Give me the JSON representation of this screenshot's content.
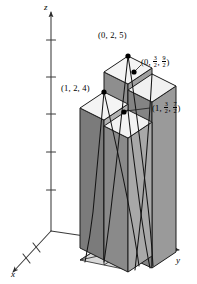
{
  "figure": {
    "kind": "3d-riemann-sum-boxes",
    "background": "#ffffff",
    "ink": "#1a1a1a"
  },
  "axes": {
    "x": {
      "label": "x",
      "direction": "down-left",
      "ticks": 2,
      "arrow": true
    },
    "y": {
      "label": "y",
      "direction": "right",
      "ticks": 0,
      "arrow": true
    },
    "z": {
      "label": "z",
      "direction": "up",
      "ticks": 5,
      "arrow": true
    }
  },
  "points": [
    {
      "id": "p-0-2-5",
      "label_parts": {
        "pre": "(0, 2, 5)",
        "frac1": null,
        "frac2": null
      }
    },
    {
      "id": "p-1-2-4",
      "label_parts": {
        "pre": "(1, 2, 4)",
        "frac1": null,
        "frac2": null
      }
    },
    {
      "id": "p-0-32-92",
      "label_parts": {
        "pre": "(0, ",
        "mid": ", ",
        "post": ")",
        "frac1": {
          "num": "3",
          "den": "2"
        },
        "frac2": {
          "num": "9",
          "den": "2"
        }
      }
    },
    {
      "id": "p-1-32-72",
      "label_parts": {
        "pre": "(1, ",
        "mid": ", ",
        "post": ")",
        "frac1": {
          "num": "3",
          "den": "2"
        },
        "frac2": {
          "num": "7",
          "den": "2"
        }
      }
    }
  ],
  "labels": {
    "top_point": "(0, 2, 5)",
    "left_point": "(1, 2, 4)",
    "x_axis": "x",
    "y_axis": "y",
    "z_axis": "z"
  },
  "colors": {
    "face_left_dark": "#7d7d7d",
    "face_left_mid": "#9a9a9a",
    "face_front": "#b5b5b5",
    "face_right": "#8a8a8a",
    "face_top": "#f2f2f2",
    "outline": "#1c1c1c",
    "curve": "#141414",
    "axis": "#3a3a3a"
  },
  "columns": [
    {
      "id": "col-back-left",
      "height_label": "5"
    },
    {
      "id": "col-back-right",
      "height_label": "4.5"
    },
    {
      "id": "col-front-left",
      "height_label": "4"
    },
    {
      "id": "col-front-right",
      "height_label": "3.5"
    }
  ]
}
